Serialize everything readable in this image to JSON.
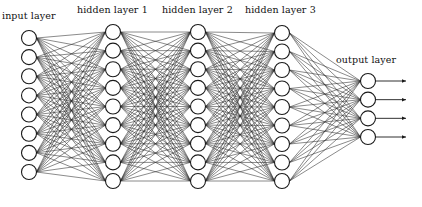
{
  "diagram": {
    "type": "feed-forward neural network",
    "colors": {
      "background": "#ffffff",
      "stroke": "#1a1a1a",
      "edge": "#2a2a2a",
      "text": "#111111"
    },
    "node_radius": 7.5,
    "layers": [
      {
        "label": "input layer",
        "nodes": 8,
        "x": 29,
        "y_first": 38,
        "y_last": 172,
        "label_x": 2,
        "label_y": 10
      },
      {
        "label": "hidden layer 1",
        "nodes": 9,
        "x": 113,
        "y_first": 32,
        "y_last": 181,
        "label_x": 77,
        "label_y": 4
      },
      {
        "label": "hidden layer 2",
        "nodes": 9,
        "x": 198,
        "y_first": 32,
        "y_last": 181,
        "label_x": 162,
        "label_y": 4
      },
      {
        "label": "hidden layer 3",
        "nodes": 9,
        "x": 282,
        "y_first": 33,
        "y_last": 181,
        "label_x": 245,
        "label_y": 4
      },
      {
        "label": "output layer",
        "nodes": 4,
        "x": 368,
        "y_first": 81,
        "y_last": 137,
        "label_x": 336,
        "label_y": 54
      }
    ],
    "connections": "fully-connected between adjacent layers",
    "outputs": {
      "arrow_count": 4,
      "arrow_end_x": 406
    }
  }
}
